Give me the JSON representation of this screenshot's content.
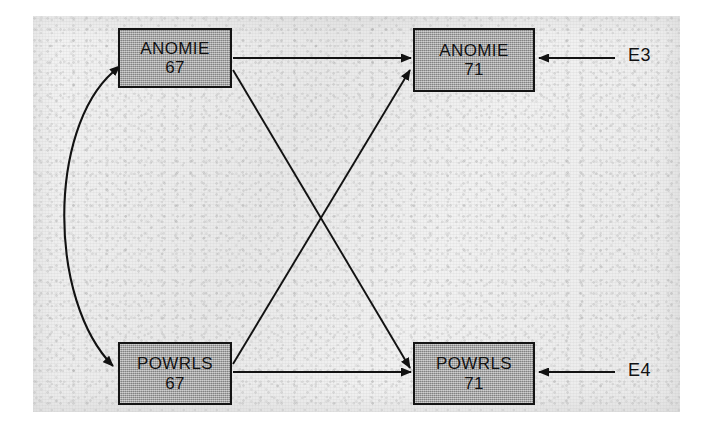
{
  "figure": {
    "type": "cross-lagged-panel-path-diagram",
    "nodes": [
      {
        "id": "anomie67",
        "label": "ANOMIE",
        "year": "67"
      },
      {
        "id": "anomie71",
        "label": "ANOMIE",
        "year": "71"
      },
      {
        "id": "powrls67",
        "label": "POWRLS",
        "year": "67"
      },
      {
        "id": "powrls71",
        "label": "POWRLS",
        "year": "71"
      }
    ],
    "residuals": [
      {
        "id": "e3",
        "label": "E3"
      },
      {
        "id": "e4",
        "label": "E4"
      }
    ],
    "edges": [
      {
        "from": "anomie67",
        "to": "anomie71",
        "kind": "directed",
        "style": "straight-horizontal"
      },
      {
        "from": "powrls67",
        "to": "powrls71",
        "kind": "directed",
        "style": "straight-horizontal"
      },
      {
        "from": "anomie67",
        "to": "powrls71",
        "kind": "directed",
        "style": "diagonal-cross"
      },
      {
        "from": "powrls67",
        "to": "anomie71",
        "kind": "directed",
        "style": "diagonal-cross"
      },
      {
        "from": "anomie67",
        "to": "powrls67",
        "kind": "bidirectional",
        "style": "curved-arc-left"
      },
      {
        "from": "e3",
        "to": "anomie71",
        "kind": "directed",
        "style": "straight-horizontal"
      },
      {
        "from": "e4",
        "to": "powrls71",
        "kind": "directed",
        "style": "straight-horizontal"
      }
    ],
    "colors": {
      "box_fill": "#9d9d9d",
      "box_border": "#141414",
      "line": "#121212",
      "panel_background": "#efefef",
      "page_background": "#ffffff"
    }
  }
}
